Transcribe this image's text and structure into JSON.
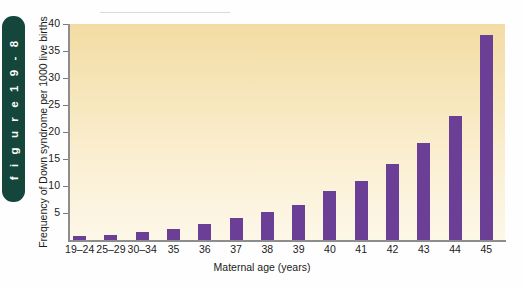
{
  "figure_tab": {
    "label": "f i g u r e   1 9 - 8",
    "plain_label": "figure 19-8",
    "color": "#14463c",
    "text_color": "#ffffff"
  },
  "chart_data": {
    "type": "bar",
    "title": "",
    "xlabel": "Maternal age (years)",
    "ylabel": "Frequency of Down syndrome per 1000 live births",
    "categories": [
      "19–24",
      "25–29",
      "30–34",
      "35",
      "36",
      "37",
      "38",
      "39",
      "40",
      "41",
      "42",
      "43",
      "44",
      "45"
    ],
    "values": [
      0.7,
      1.0,
      1.4,
      2.0,
      3.0,
      4.0,
      5.2,
      6.4,
      9.0,
      11.0,
      14.0,
      18.0,
      23.0,
      38.0
    ],
    "ylim": [
      0,
      40
    ],
    "yticks": [
      0,
      5,
      10,
      15,
      20,
      25,
      30,
      35,
      40
    ],
    "ytick_labels": [
      "",
      "5",
      "10",
      "15",
      "20",
      "25",
      "30",
      "35",
      "40"
    ],
    "grid": false,
    "legend": "none",
    "bar_color": "#6b3f95",
    "plot_bg_top": "#f3dca4",
    "plot_bg_bottom": "#fdf7e8",
    "axis_color": "#8d8d8d"
  }
}
